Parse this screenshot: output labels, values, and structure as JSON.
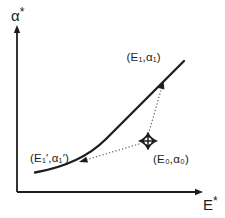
{
  "colors": {
    "ink": "#1d1d1b",
    "dotted": "#4a4a4a",
    "background": "#ffffff"
  },
  "axes": {
    "y": {
      "symbol": "α",
      "superscript": "*"
    },
    "x": {
      "symbol": "E",
      "superscript": "*"
    }
  },
  "labels": {
    "point_e1": "(E₁,α₁)",
    "point_e1_prime": "(E₁′,α₁′)",
    "point_e0": "(E₀,α₀)"
  },
  "marker": {
    "name": "crosshair-diamond",
    "shape": "four-pointed black star with white crosshair center"
  }
}
